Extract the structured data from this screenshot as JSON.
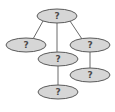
{
  "diagram": {
    "type": "tree",
    "colors": {
      "node_fill": "#d6d6d6",
      "node_stroke": "#5a5a5a",
      "edge": "#6a6a6a",
      "label": "#4a4a4a",
      "background": "#ffffff"
    },
    "nodes": [
      {
        "id": "root",
        "label": "?",
        "cx": 57,
        "cy": 16,
        "rx": 20,
        "ry": 7
      },
      {
        "id": "left",
        "label": "?",
        "cx": 26,
        "cy": 45,
        "rx": 20,
        "ry": 7
      },
      {
        "id": "middle",
        "label": "?",
        "cx": 58,
        "cy": 59,
        "rx": 20,
        "ry": 7
      },
      {
        "id": "right",
        "label": "?",
        "cx": 90,
        "cy": 45,
        "rx": 20,
        "ry": 7
      },
      {
        "id": "right-child",
        "label": "?",
        "cx": 90,
        "cy": 75,
        "rx": 20,
        "ry": 7
      },
      {
        "id": "middle-child",
        "label": "?",
        "cx": 58,
        "cy": 92,
        "rx": 20,
        "ry": 7
      }
    ],
    "edges": [
      {
        "from": "root",
        "to": "left",
        "x1": 43,
        "y1": 21,
        "x2": 33,
        "y2": 39
      },
      {
        "from": "root",
        "to": "middle",
        "x1": 57,
        "y1": 23,
        "x2": 57,
        "y2": 52
      },
      {
        "from": "root",
        "to": "right",
        "x1": 70,
        "y1": 21,
        "x2": 82,
        "y2": 39
      },
      {
        "from": "right",
        "to": "right-child",
        "x1": 90,
        "y1": 52,
        "x2": 90,
        "y2": 68
      },
      {
        "from": "middle",
        "to": "middle-child",
        "x1": 58,
        "y1": 66,
        "x2": 58,
        "y2": 85
      }
    ]
  }
}
